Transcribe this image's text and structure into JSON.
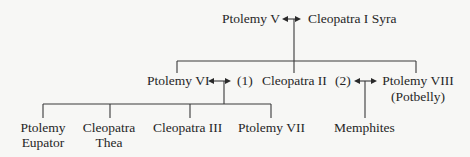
{
  "diagram": {
    "type": "family-tree",
    "generation_1": {
      "left": "Ptolemy V",
      "right": "Cleopatra I Syra",
      "relation_icon": "double-arrow-icon"
    },
    "generation_2": {
      "left": "Ptolemy VI",
      "marriage_1_label": "(1)",
      "center": "Cleopatra II",
      "marriage_2_label": "(2)",
      "right_line1": "Ptolemy VIII",
      "right_line2": "(Potbelly)"
    },
    "generation_3_marriage_1": [
      {
        "line1": "Ptolemy",
        "line2": "Eupator"
      },
      {
        "line1": "Cleopatra",
        "line2": "Thea"
      },
      {
        "line1": "Cleopatra III",
        "line2": ""
      },
      {
        "line1": "Ptolemy VII",
        "line2": ""
      }
    ],
    "generation_3_marriage_2": [
      {
        "line1": "Memphites",
        "line2": ""
      }
    ]
  }
}
